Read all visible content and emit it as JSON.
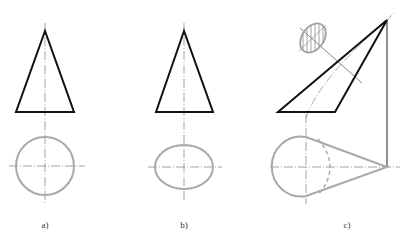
{
  "figure": {
    "panels": [
      {
        "id": "a",
        "label": "a)",
        "description": "Cone: front view triangle, top view circle"
      },
      {
        "id": "b",
        "label": "b)",
        "description": "Cone: front view triangle, top view ellipse"
      },
      {
        "id": "c",
        "label": "c)",
        "description": "Oblique cone with hatched elliptical section and top view with tangent lines"
      }
    ],
    "colors": {
      "outline": "#111111",
      "gray_view": "#a8a8a8",
      "center_line": "#555555",
      "hatch": "#9a9a9a"
    }
  }
}
